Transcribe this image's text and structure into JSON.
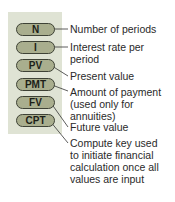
{
  "keys": [
    {
      "label": "N",
      "description": [
        "Number of periods"
      ]
    },
    {
      "label": "I",
      "description": [
        "Interest rate per",
        "period"
      ]
    },
    {
      "label": "PV",
      "description": [
        "Present value"
      ]
    },
    {
      "label": "PMT",
      "description": [
        "Amount of payment",
        "(used only for",
        "annuities)"
      ]
    },
    {
      "label": "FV",
      "description": [
        "Future value"
      ]
    },
    {
      "label": "CPT",
      "description": [
        "Compute key used",
        "to initiate financial",
        "calculation once all",
        "values are input"
      ]
    }
  ],
  "colors": {
    "panel": "#dfe3d4",
    "key_fill": "#a9ae8e",
    "key_border": "#3e4236",
    "text": "#2a2a2a"
  }
}
